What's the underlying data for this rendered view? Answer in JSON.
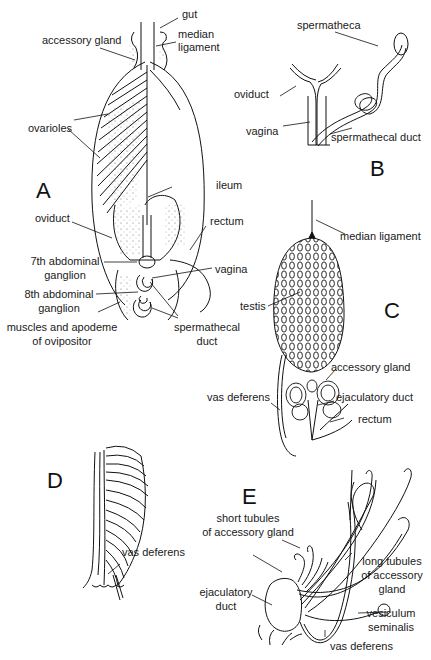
{
  "figure": {
    "panels": [
      {
        "letter": "A",
        "labels": {
          "gut": "gut",
          "accessory_gland": "accessory gland",
          "median_ligament_1": "median",
          "median_ligament_2": "ligament",
          "ovarioles": "ovarioles",
          "ileum": "ileum",
          "oviduct": "oviduct",
          "rectum": "rectum",
          "ganglion7_1": "7th abdominal",
          "ganglion7_2": "ganglion",
          "vagina": "vagina",
          "ganglion8_1": "8th abdominal",
          "ganglion8_2": "ganglion",
          "muscles_1": "muscles and apodeme",
          "muscles_2": "of ovipositor",
          "spermathecal_duct_1": "spermathecal",
          "spermathecal_duct_2": "duct"
        }
      },
      {
        "letter": "B",
        "labels": {
          "spermatheca": "spermatheca",
          "oviduct": "oviduct",
          "vagina": "vagina",
          "spermathecal_duct": "spermathecal duct"
        }
      },
      {
        "letter": "C",
        "labels": {
          "median_ligament": "median ligament",
          "testis": "testis",
          "accessory_gland": "accessory gland",
          "vas_deferens": "vas deferens",
          "ejaculatory_duct": "ejaculatory duct",
          "rectum": "rectum"
        }
      },
      {
        "letter": "D",
        "labels": {
          "vas_deferens": "vas deferens"
        }
      },
      {
        "letter": "E",
        "labels": {
          "short_tubules_1": "short tubules",
          "short_tubules_2": "of accessory gland",
          "long_tubules_1": "long tubules",
          "long_tubules_2": "of accessory",
          "long_tubules_3": "gland",
          "ejaculatory_duct_1": "ejaculatory",
          "ejaculatory_duct_2": "duct",
          "vesiculum_1": "vesiculum",
          "vesiculum_2": "seminalis",
          "vas_deferens": "vas deferens"
        }
      }
    ]
  }
}
